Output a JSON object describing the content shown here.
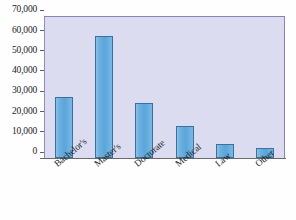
{
  "chart_data": {
    "type": "bar",
    "title": "",
    "xlabel": "",
    "ylabel": "",
    "categories": [
      "Bachelor's",
      "Master's",
      "Doctorate",
      "Medical",
      "Law",
      "Other"
    ],
    "values": [
      30000,
      60000,
      27000,
      16000,
      7000,
      5000
    ],
    "ylim": [
      0,
      70000
    ],
    "ytick_labels": [
      "70,000",
      "60,000",
      "50,000",
      "40,000",
      "30,000",
      "20,000",
      "10,000",
      "0"
    ],
    "ytick_values": [
      70000,
      60000,
      50000,
      40000,
      30000,
      20000,
      10000,
      0
    ],
    "grid": false,
    "legend": "none",
    "colors": {
      "bar_fill": "#5aa5da",
      "bar_border": "#3a6f9e",
      "plot_background": "#dcdcf0",
      "plot_border": "#8f7fb8",
      "axis_text": "#1c1c1c",
      "baseline": "#6a6a6a"
    }
  }
}
